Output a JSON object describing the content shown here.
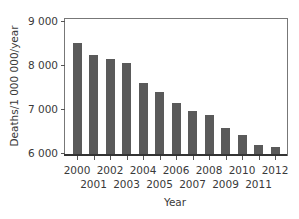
{
  "chart_data": {
    "type": "bar",
    "title": "",
    "xlabel": "Year",
    "ylabel": "Deaths/1 000 000/year",
    "ylim": [
      6000,
      9000
    ],
    "yticks": [
      6000,
      7000,
      8000,
      9000
    ],
    "ytick_labels": [
      "6 000",
      "7 000",
      "8 000",
      "9 000"
    ],
    "grid": false,
    "legend": null,
    "categories": [
      "2000",
      "2001",
      "2002",
      "2003",
      "2004",
      "2005",
      "2006",
      "2007",
      "2008",
      "2009",
      "2010",
      "2011",
      "2012"
    ],
    "values": [
      8490,
      8220,
      8130,
      8040,
      7590,
      7390,
      7140,
      6950,
      6860,
      6570,
      6410,
      6180,
      6140
    ],
    "bar_color": "#5a5a5a"
  }
}
